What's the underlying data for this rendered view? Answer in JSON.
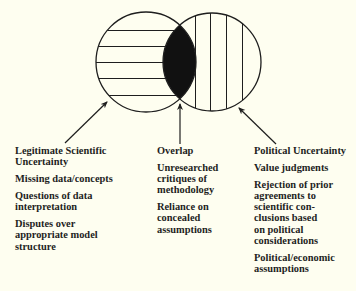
{
  "colors": {
    "background": "#fefef0",
    "ink": "#1e1e1e",
    "overlap_fill": "#111111"
  },
  "diagram": {
    "left_circle": {
      "label": "Legitimate Scientific Uncertainty",
      "pattern": "horizontal-hatch",
      "cx": 146,
      "cy": 62,
      "r": 50
    },
    "right_circle": {
      "label": "Political Uncertainty",
      "pattern": "vertical-hatch",
      "cx": 212,
      "cy": 62,
      "r": 49
    },
    "overlap": {
      "label": "Overlap",
      "fill": "solid-black"
    }
  },
  "columns": {
    "left": {
      "heading": "Legitimate Scientific\nUncertainty",
      "items": [
        "Missing data/concepts",
        "Questions of data\ninterpretation",
        "Disputes over\nappropriate model\nstructure"
      ]
    },
    "middle": {
      "heading": "Overlap",
      "items": [
        "Unresearched\ncritiques of\nmethodology",
        "Reliance on\nconcealed\nassumptions"
      ]
    },
    "right": {
      "heading": "Political Uncertainty",
      "items": [
        "Value judgments",
        "Rejection of prior\nagreements to\nscientific con-\nclusions based\non political\nconsiderations",
        "Political/economic\nassumptions"
      ]
    }
  }
}
